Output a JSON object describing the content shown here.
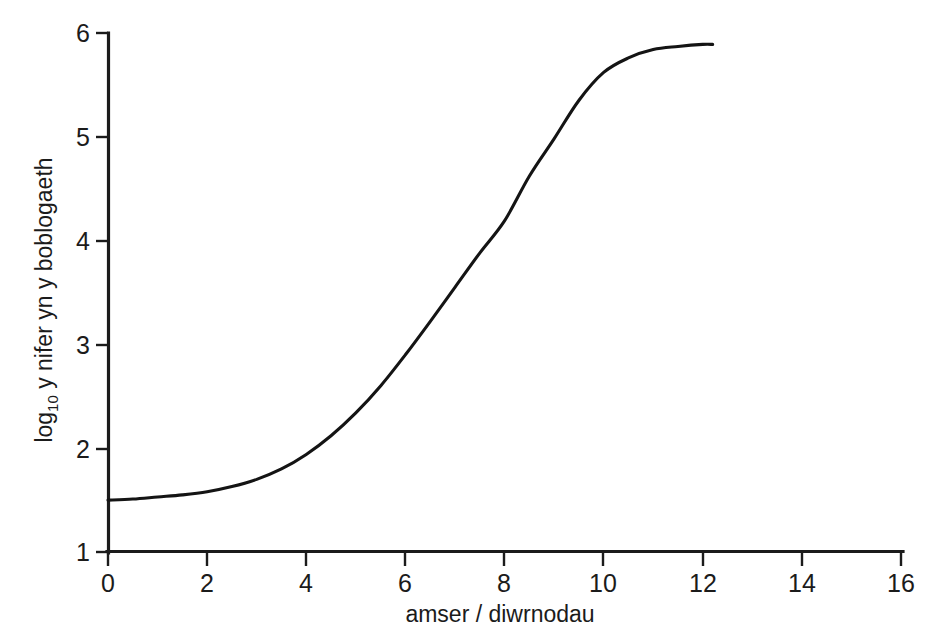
{
  "chart_data": {
    "type": "line",
    "title": "",
    "xlabel": "amser / diwrnodau",
    "ylabel_prefix": "log",
    "ylabel_subscript": "10",
    "ylabel_rest": " y nifer yn y boblogaeth",
    "ylabel_full": "log10 y nifer yn y boblogaeth",
    "xlim": [
      0,
      16
    ],
    "ylim": [
      1,
      6
    ],
    "xticks": [
      0,
      2,
      4,
      6,
      8,
      10,
      12,
      14,
      16
    ],
    "xtick_labels": [
      "0",
      "2",
      "4",
      "6",
      "8",
      "10",
      "12",
      "14",
      "16"
    ],
    "yticks": [
      1,
      2,
      3,
      4,
      5,
      6
    ],
    "ytick_labels": [
      "1",
      "2",
      "3",
      "4",
      "5",
      "6"
    ],
    "grid": false,
    "legend": false,
    "series": [
      {
        "name": "twf poblogaeth",
        "color": "#141414",
        "x": [
          0.0,
          0.5,
          1.0,
          1.5,
          2.0,
          2.5,
          3.0,
          3.5,
          4.0,
          4.5,
          5.0,
          5.5,
          6.0,
          6.5,
          7.0,
          7.5,
          8.0,
          8.5,
          9.0,
          9.5,
          10.0,
          10.5,
          11.0,
          11.5,
          12.0,
          12.2
        ],
        "y": [
          1.5,
          1.51,
          1.53,
          1.55,
          1.58,
          1.63,
          1.7,
          1.8,
          1.94,
          2.12,
          2.34,
          2.6,
          2.9,
          3.22,
          3.55,
          3.88,
          4.19,
          4.62,
          4.98,
          5.35,
          5.62,
          5.76,
          5.84,
          5.87,
          5.89,
          5.89
        ]
      }
    ],
    "annotations": []
  },
  "axis_color": "#1b1b1b",
  "curve_color": "#141414",
  "background_color": "#ffffff"
}
